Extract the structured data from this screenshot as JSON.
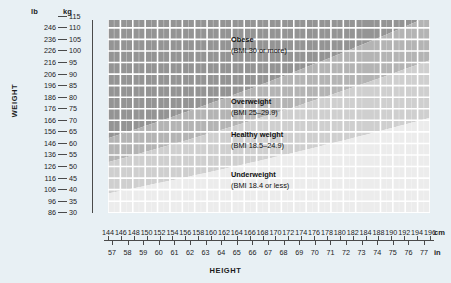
{
  "chart_data": {
    "type": "area",
    "xlabel": "HEIGHT",
    "ylabel": "WEIGHT",
    "grid": true,
    "legend_position": "in-plot annotations",
    "x_axis": {
      "primary_unit": "cm",
      "primary_ticks": [
        144,
        146,
        148,
        150,
        152,
        154,
        156,
        158,
        160,
        162,
        164,
        166,
        168,
        170,
        172,
        174,
        176,
        178,
        180,
        182,
        184,
        188,
        190,
        192,
        194,
        196
      ],
      "primary_range": [
        144,
        196
      ],
      "secondary_unit": "in",
      "secondary_ticks": [
        57,
        58,
        59,
        60,
        61,
        62,
        63,
        64,
        65,
        66,
        67,
        68,
        69,
        70,
        71,
        72,
        73,
        74,
        75,
        76,
        77
      ],
      "secondary_range": [
        56.7,
        77.2
      ]
    },
    "y_axis": {
      "primary_unit": "lb",
      "primary_ticks": [
        246,
        236,
        226,
        216,
        206,
        196,
        186,
        176,
        166,
        156,
        146,
        136,
        126,
        116,
        106,
        96,
        86,
        76,
        66
      ],
      "primary_range": [
        66,
        250
      ],
      "secondary_unit": "kg",
      "secondary_ticks": [
        115,
        110,
        105,
        100,
        95,
        90,
        85,
        80,
        75,
        70,
        65,
        60,
        55,
        50,
        45,
        40,
        35,
        30
      ],
      "secondary_range": [
        29.9,
        113.4
      ],
      "inverted": true
    },
    "bands": [
      {
        "id": "obese",
        "name": "Obese",
        "detail": "(BMI 30 or more)",
        "bmi_min": 30,
        "bmi_max": null,
        "color": "#949494",
        "label_x_cm": 166,
        "label_y_kg": 103
      },
      {
        "id": "overweight",
        "name": "Overweight",
        "detail": "(BMI 25–29.9)",
        "bmi_min": 25,
        "bmi_max": 29.9,
        "color": "#b4b4b4",
        "label_x_cm": 166,
        "label_y_kg": 82
      },
      {
        "id": "healthy",
        "name": "Healthy weight",
        "detail": "(BMI 18.5–24.9)",
        "bmi_min": 18.5,
        "bmi_max": 24.9,
        "color": "#cfcfcf",
        "label_x_cm": 166,
        "label_y_kg": 66
      },
      {
        "id": "underweight",
        "name": "Underweight",
        "detail": "(BMI 18.4 or less)",
        "bmi_min": null,
        "bmi_max": 18.4,
        "color": "#ececec",
        "label_x_cm": 166,
        "label_y_kg": 50
      }
    ],
    "boundary_curves": [
      {
        "bmi": 30.0,
        "y_at_144cm_kg": 62.2,
        "y_at_196cm_kg": 115.2
      },
      {
        "bmi": 25.0,
        "y_at_144cm_kg": 51.8,
        "y_at_196cm_kg": 96.0
      },
      {
        "bmi": 18.5,
        "y_at_144cm_kg": 38.4,
        "y_at_196cm_kg": 71.1
      }
    ]
  },
  "axes": {
    "weight_label": "WEIGHT",
    "height_label": "HEIGHT",
    "unit_lb": "lb",
    "unit_kg": "kg",
    "unit_cm": "cm",
    "unit_in": "in"
  },
  "colors": {
    "page_background": "#e8f0f4",
    "grid_line": "#ffffff",
    "axis_line": "#4a4a4a",
    "text": "#1c1c1c"
  }
}
